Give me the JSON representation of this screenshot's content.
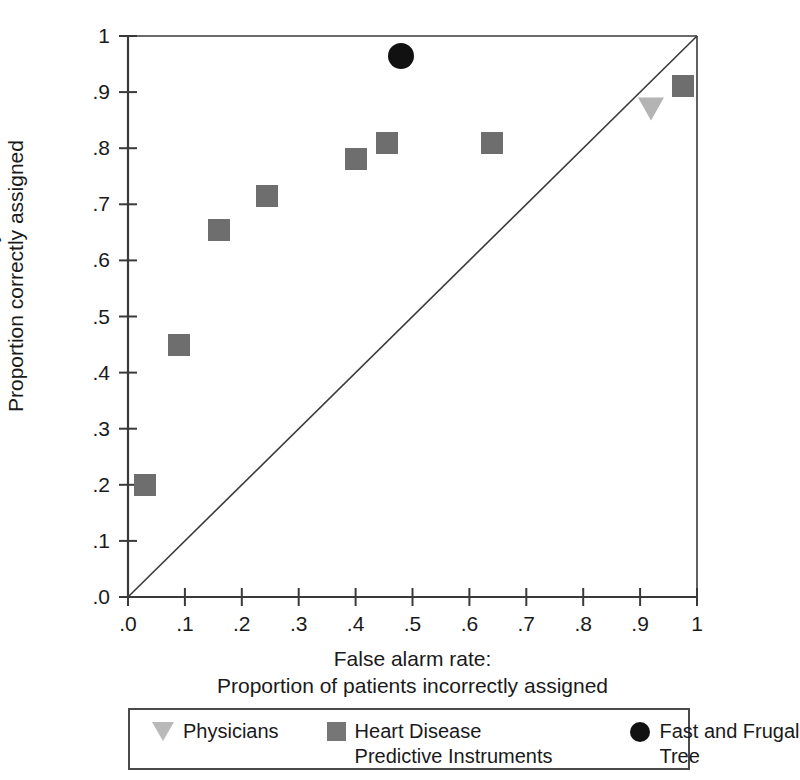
{
  "chart_data": {
    "type": "scatter",
    "title": "",
    "xlabel": "False alarm rate: Proportion of patients incorrectly assigned",
    "ylabel": "Sensitivity: Proportion correctly assigned",
    "xlabel_lines": [
      "False alarm rate:",
      "Proportion of patients incorrectly assigned"
    ],
    "ylabel_lines": [
      "Sensitivity:",
      "Proportion correctly assigned"
    ],
    "xlim": [
      0,
      1
    ],
    "ylim": [
      0,
      1
    ],
    "grid": false,
    "legend_position": "below-plot",
    "xticks": [
      ".0",
      ".1",
      ".2",
      ".3",
      ".4",
      ".5",
      ".6",
      ".7",
      ".8",
      ".9",
      "1"
    ],
    "xtick_values": [
      0,
      0.1,
      0.2,
      0.3,
      0.4,
      0.5,
      0.6,
      0.7,
      0.8,
      0.9,
      1.0
    ],
    "yticks": [
      ".0",
      ".1",
      ".2",
      ".3",
      ".4",
      ".5",
      ".6",
      ".7",
      ".8",
      ".9",
      "1"
    ],
    "ytick_values": [
      0,
      0.1,
      0.2,
      0.3,
      0.4,
      0.5,
      0.6,
      0.7,
      0.8,
      0.9,
      1.0
    ],
    "reference_line": {
      "name": "chance-diagonal",
      "from": [
        0,
        0
      ],
      "to": [
        1,
        1
      ],
      "color": "#3a3a3a"
    },
    "series": [
      {
        "name": "Physicians",
        "marker": "triangle-down",
        "color": "#b4b4b4",
        "points": [
          {
            "x": 0.92,
            "y": 0.87
          }
        ]
      },
      {
        "name": "Heart Disease Predictive Instruments",
        "marker": "square",
        "color": "#6e6e6e",
        "points": [
          {
            "x": 0.03,
            "y": 0.2
          },
          {
            "x": 0.09,
            "y": 0.45
          },
          {
            "x": 0.16,
            "y": 0.655
          },
          {
            "x": 0.245,
            "y": 0.715
          },
          {
            "x": 0.4,
            "y": 0.78
          },
          {
            "x": 0.455,
            "y": 0.81
          },
          {
            "x": 0.64,
            "y": 0.81
          },
          {
            "x": 0.975,
            "y": 0.91
          }
        ]
      },
      {
        "name": "Fast and Frugal Tree",
        "marker": "circle",
        "color": "#111111",
        "points": [
          {
            "x": 0.48,
            "y": 0.965
          }
        ]
      }
    ]
  },
  "legend": {
    "entries": [
      {
        "label_lines": [
          "Physicians"
        ],
        "marker": "triangle-down-icon"
      },
      {
        "label_lines": [
          "Heart Disease",
          "Predictive Instruments"
        ],
        "marker": "square-icon"
      },
      {
        "label_lines": [
          "Fast and Frugal",
          "Tree"
        ],
        "marker": "circle-icon"
      }
    ]
  },
  "colors": {
    "axis": "#3a3a3a",
    "text": "#1a1a1a",
    "background": "#ffffff",
    "physicians": "#b4b4b4",
    "heart_disease": "#6e6e6e",
    "fast_frugal": "#111111"
  }
}
